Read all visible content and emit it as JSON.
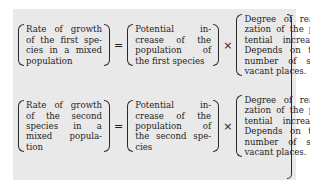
{
  "equations": [
    {
      "left": [
        "Rate of growth",
        "of the first spe-",
        "cies in a mixed",
        "population"
      ],
      "equals": "=",
      "middle": [
        "Potential in-",
        "crease of the",
        "population of",
        "the first species"
      ],
      "times": "×",
      "right": [
        "Degree of reali-",
        "zation of the po-",
        "tential increase.",
        "Depends on the",
        "number of still",
        "vacant places."
      ]
    },
    {
      "left": [
        "Rate of growth",
        "of the second",
        "species in a",
        "mixed popula-",
        "tion"
      ],
      "equals": "=",
      "middle": [
        "Potential in-",
        "crease of the",
        "population of",
        "the second spe-",
        "cies"
      ],
      "times": "×",
      "right": [
        "Degree of reali-",
        "zation of the po-",
        "tential increase.",
        "Depends on the",
        "number of still",
        "vacant places."
      ]
    }
  ],
  "colors": {
    "panel": "#e9e9e9",
    "text": "#1f1f1f"
  }
}
